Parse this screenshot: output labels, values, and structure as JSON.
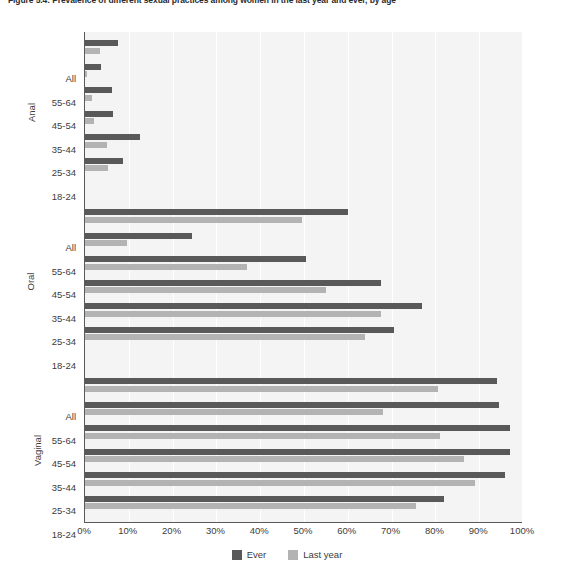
{
  "figure": {
    "title": "Figure 5.4: Prevalence of different sexual practices among women in the last year and ever, by age"
  },
  "legend": {
    "items": [
      {
        "label": "Ever",
        "color": "#595959",
        "key": "ever"
      },
      {
        "label": "Last year",
        "color": "#b3b3b3",
        "key": "last_year"
      }
    ]
  },
  "axis": {
    "x_ticks": [
      "0%",
      "10%",
      "20%",
      "30%",
      "40%",
      "50%",
      "60%",
      "70%",
      "80%",
      "90%",
      "100%"
    ],
    "x_min": 0,
    "x_max": 100
  },
  "chart_data": {
    "type": "bar",
    "orientation": "horizontal",
    "title": "Figure 5.4: Prevalence of different sexual practices among women in the last year and ever, by age",
    "xlabel": "",
    "ylabel": "",
    "xlim": [
      0,
      100
    ],
    "grid": true,
    "legend_position": "bottom",
    "series_names": [
      "Ever",
      "Last year"
    ],
    "series_colors": [
      "#595959",
      "#b3b3b3"
    ],
    "groups": [
      {
        "name": "Anal",
        "categories": [
          "All",
          "55-64",
          "45-54",
          "35-44",
          "25-34",
          "18-24"
        ],
        "series": [
          {
            "name": "Ever",
            "values": [
              7.5,
              3.7,
              6.1,
              6.5,
              12.5,
              8.7
            ]
          },
          {
            "name": "Last year",
            "values": [
              3.4,
              0.5,
              1.7,
              2.1,
              5.0,
              5.3
            ]
          }
        ]
      },
      {
        "name": "Oral",
        "categories": [
          "All",
          "55-64",
          "45-54",
          "35-44",
          "25-34",
          "18-24"
        ],
        "series": [
          {
            "name": "Ever",
            "values": [
              60.0,
              24.5,
              50.5,
              67.5,
              77.0,
              70.5
            ]
          },
          {
            "name": "Last year",
            "values": [
              49.5,
              9.5,
              37.0,
              55.0,
              67.5,
              64.0
            ]
          }
        ]
      },
      {
        "name": "Vaginal",
        "categories": [
          "All",
          "55-64",
          "45-54",
          "35-44",
          "25-34",
          "18-24"
        ],
        "series": [
          {
            "name": "Ever",
            "values": [
              94.0,
              94.5,
              97.0,
              97.0,
              96.0,
              82.0
            ]
          },
          {
            "name": "Last year",
            "values": [
              80.5,
              68.0,
              81.0,
              86.5,
              89.0,
              75.5
            ]
          }
        ]
      }
    ]
  }
}
